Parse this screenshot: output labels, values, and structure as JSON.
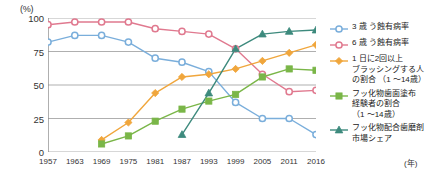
{
  "axis": {
    "unit_label": "(%)",
    "y_ticks": [
      "100",
      "75",
      "50",
      "25",
      "0"
    ],
    "x_ticks": [
      "1957",
      "1963",
      "1969",
      "1975",
      "1981",
      "1987",
      "1993",
      "1999",
      "2005",
      "2011",
      "2016"
    ],
    "x_unit": "(年)"
  },
  "legend": {
    "items": [
      {
        "label": "3 歳 う蝕有病率",
        "color": "#7aaedb",
        "marker": "open-circle"
      },
      {
        "label": "6 歳 う蝕有病率",
        "color": "#e0798f",
        "marker": "open-circle"
      },
      {
        "label": "1 日に2回以上\nブラッシングする人\nの割合 （1 〜14歳）",
        "color": "#f0a63c",
        "marker": "filled-diamond"
      },
      {
        "label": "フッ化物歯面塗布\n経験者の割合\n（1 〜14歳）",
        "color": "#7ab648",
        "marker": "filled-square"
      },
      {
        "label": "フッ化物配合歯磨剤\n市場シェア",
        "color": "#3d8a7d",
        "marker": "filled-triangle"
      }
    ]
  },
  "chart_data": {
    "type": "line",
    "title": "",
    "xlabel": "(年)",
    "ylabel": "(%)",
    "ylim": [
      0,
      100
    ],
    "y_gridlines": [
      0,
      25,
      50,
      75,
      100
    ],
    "grid": true,
    "legend_position": "right",
    "categories": [
      "1957",
      "1963",
      "1969",
      "1975",
      "1981",
      "1987",
      "1993",
      "1999",
      "2005",
      "2011",
      "2016"
    ],
    "series": [
      {
        "name": "3 歳 う蝕有病率",
        "color": "#7aaedb",
        "marker": "open-circle",
        "values": [
          82,
          87,
          87,
          82,
          70,
          67,
          60,
          37,
          25,
          25,
          13
        ]
      },
      {
        "name": "6 歳 う蝕有病率",
        "color": "#e0798f",
        "marker": "open-circle",
        "values": [
          95,
          97,
          97,
          97,
          92,
          90,
          88,
          77,
          58,
          45,
          46
        ]
      },
      {
        "name": "1 日に2回以上ブラッシングする人の割合 （1 〜14歳）",
        "color": "#f0a63c",
        "marker": "filled-diamond",
        "values": [
          null,
          null,
          9,
          22,
          44,
          56,
          58,
          62,
          68,
          74,
          80
        ]
      },
      {
        "name": "フッ化物歯面塗布経験者の割合 （1 〜14歳）",
        "color": "#7ab648",
        "marker": "filled-square",
        "values": [
          null,
          null,
          6,
          12,
          23,
          32,
          38,
          43,
          56,
          62,
          61
        ]
      },
      {
        "name": "フッ化物配合歯磨剤市場シェア",
        "color": "#3d8a7d",
        "marker": "filled-triangle",
        "values": [
          null,
          null,
          null,
          null,
          null,
          13,
          44,
          77,
          88,
          90,
          91
        ]
      }
    ]
  }
}
